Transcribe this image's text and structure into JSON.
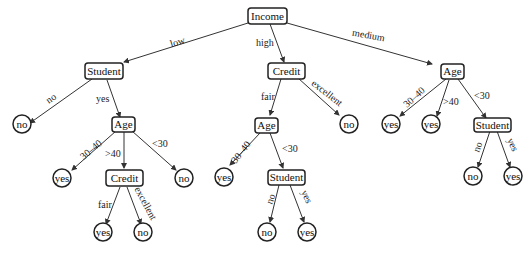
{
  "diagram": {
    "type": "decision-tree",
    "nodes": {
      "root": "Income",
      "student1": "Student",
      "credit1": "Credit",
      "age3": "Age",
      "leaf_no1": "no",
      "age1": "Age",
      "leaf_yes1": "yes",
      "credit2": "Credit",
      "leaf_no2": "no",
      "leaf_yes2": "yes",
      "leaf_no3": "no",
      "age2": "Age",
      "leaf_no4": "no",
      "leaf_yes3": "yes",
      "student2": "Student",
      "leaf_no5": "no",
      "leaf_yes4": "yes",
      "leaf_yes5": "yes",
      "leaf_yes6": "yes",
      "student3": "Student",
      "leaf_no6": "no",
      "leaf_yes7": "yes"
    },
    "edges": {
      "low": "low",
      "high": "high",
      "medium": "medium",
      "s1_no": "no",
      "s1_yes": "yes",
      "a1_3040": "30–40",
      "a1_gt40": ">40",
      "a1_lt30": "<30",
      "c2_fair": "fair",
      "c2_excellent": "excellent",
      "c1_fair": "fair",
      "c1_excellent": "excellent",
      "a2_3040": "30–40",
      "a2_lt30": "<30",
      "s2_no": "no",
      "s2_yes": "yes",
      "a3_3040": "30–40",
      "a3_gt40": ">40",
      "a3_lt30": "<30",
      "s3_no": "no",
      "s3_yes": "yes"
    }
  }
}
